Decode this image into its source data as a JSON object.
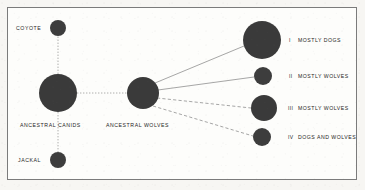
{
  "figure": {
    "type": "node-link-diagram",
    "background_color": "#fdfdfb",
    "border_color": "#7b7b7b",
    "node_color": "#3b3b3b",
    "link_color": "#8f8f8f",
    "nodes": [
      {
        "id": "coyote",
        "label": "COYOTE",
        "cx": 58,
        "cy": 28,
        "r": 8,
        "label_x": 16,
        "label_y": 26,
        "label_align": "left"
      },
      {
        "id": "ancestral-canids",
        "label": "ANCESTRAL CANIDS",
        "cx": 58,
        "cy": 93,
        "r": 19,
        "label_x": 20,
        "label_y": 123,
        "label_align": "left"
      },
      {
        "id": "jackal",
        "label": "JACKAL",
        "cx": 58,
        "cy": 160,
        "r": 8,
        "label_x": 18,
        "label_y": 158,
        "label_align": "left"
      },
      {
        "id": "ancestral-wolves",
        "label": "ANCESTRAL WOLVES",
        "cx": 143,
        "cy": 93,
        "r": 16,
        "label_x": 106,
        "label_y": 123,
        "label_align": "left"
      },
      {
        "id": "group-i",
        "label": "MOSTLY DOGS",
        "roman": "I",
        "cx": 262,
        "cy": 40,
        "r": 19,
        "roman_x": 289,
        "label_x": 298,
        "label_y": 38
      },
      {
        "id": "group-ii",
        "label": "MOSTLY WOLVES",
        "roman": "II",
        "cx": 263,
        "cy": 76,
        "r": 9,
        "roman_x": 289,
        "label_x": 298,
        "label_y": 74
      },
      {
        "id": "group-iii",
        "label": "MOSTLY WOLVES",
        "roman": "III",
        "cx": 264,
        "cy": 108,
        "r": 13,
        "roman_x": 289,
        "label_x": 298,
        "label_y": 106
      },
      {
        "id": "group-iv",
        "label": "DOGS AND WOLVES",
        "roman": "IV",
        "cx": 262,
        "cy": 137,
        "r": 9,
        "roman_x": 289,
        "label_x": 298,
        "label_y": 135
      }
    ],
    "links": [
      {
        "id": "link-canids-coyote",
        "from": "ancestral-canids",
        "to": "coyote",
        "style": "dotted"
      },
      {
        "id": "link-canids-jackal",
        "from": "ancestral-canids",
        "to": "jackal",
        "style": "dotted"
      },
      {
        "id": "link-canids-wolves",
        "from": "ancestral-canids",
        "to": "ancestral-wolves",
        "style": "dotted"
      },
      {
        "id": "link-wolves-i",
        "from": "ancestral-wolves",
        "to": "group-i",
        "style": "solid"
      },
      {
        "id": "link-wolves-ii",
        "from": "ancestral-wolves",
        "to": "group-ii",
        "style": "solid"
      },
      {
        "id": "link-wolves-iii",
        "from": "ancestral-wolves",
        "to": "group-iii",
        "style": "dashed"
      },
      {
        "id": "link-wolves-iv",
        "from": "ancestral-wolves",
        "to": "group-iv",
        "style": "dashed"
      }
    ]
  }
}
